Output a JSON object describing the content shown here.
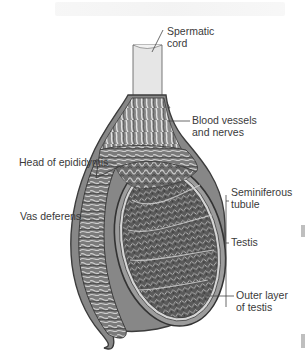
{
  "figure": {
    "labels": {
      "spermatic_cord": [
        "Spermatic",
        "cord"
      ],
      "blood_vessels": [
        "Blood vessels",
        "and nerves"
      ],
      "head_epididymis": [
        "Head of epididymis"
      ],
      "vas_deferens": [
        "Vas deferens"
      ],
      "seminiferous": [
        "Seminiferous",
        "tubule"
      ],
      "testis": [
        "Testis"
      ],
      "outer_layer": [
        "Outer layer",
        "of testis"
      ]
    },
    "colors": {
      "outline": "#3c3c3c",
      "cord_fill": "#e6e6e6",
      "body_fill": "#8a8a8a",
      "tubule_dark": "#555555",
      "tubule_light": "#c8c8c8",
      "label_text": "#3a3a3a",
      "leader_line": "#444444",
      "margin_mark": "#bfbfbf"
    }
  }
}
